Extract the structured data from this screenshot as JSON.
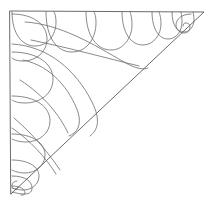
{
  "figure": {
    "background_color": "#ffffff",
    "line_color": "#5a5a5a",
    "plume_line_color": "#6b6b6b",
    "width": 214,
    "height": 205
  },
  "triangle": {
    "name": "outer-triangle",
    "vertices": {
      "top_left": {
        "x": 10,
        "y": 11
      },
      "top_right": {
        "x": 204,
        "y": 12
      },
      "bottom_left": {
        "x": 11,
        "y": 194
      }
    },
    "path": "M10,11 L204,12 L11,194 Z"
  },
  "top_plumes": {
    "name": "top-edge-plumes",
    "count": 6,
    "note": "Teardrop plumes hanging from the top edge, decreasing in size toward the right apex",
    "paths": [
      "M12,12 C12,34 22,46 35,46 C48,46 56,35 56,22 C56,14 54,12 54,12",
      "M46,12 C46,38 57,52 72,52 C87,52 96,38 96,23 C96,14 94,12 94,12",
      "M86,12 C86,36 97,50 111,50 C124,50 132,37 132,25 C132,16 130,12 130,12",
      "M122,12 C122,33 131,45 143,45 C154,45 161,34 161,24 C161,16 159,12 159,12",
      "M152,12 C152,29 159,39 168,39 C177,39 182,30 182,22 C182,16 181,12 181,12",
      "M172,12 C172,25 177,32 184,32 C190,32 194,26 194,20 C194,15 193,12 193,12"
    ]
  },
  "left_plumes": {
    "name": "left-edge-plumes",
    "count": 7,
    "note": "Teardrop plumes extending from the left edge, decreasing in size toward the bottom vertex",
    "paths": [
      "M12,14 C34,14 47,25 47,39 C47,52 36,61 23,61 C14,61 12,58 12,58",
      "M12,52 C38,52 53,64 53,79 C53,94 40,103 25,103 C15,103 12,100 12,100",
      "M12,96 C36,96 50,107 50,121 C50,134 38,142 26,142 C17,142 12,139 12,139",
      "M12,134 C33,134 45,143 45,155 C45,166 35,173 25,173 C17,173 12,170 12,170",
      "M12,160 C29,160 39,167 39,176 C39,185 31,190 23,190 C17,190 12,188 12,188",
      "M12,176 C25,176 32,181 32,188 C32,193 28,194 24,194 C19,194 12,192 12,192",
      "M12,186 C20,186 25,189 25,193 C25,195 23,195 21,195"
    ]
  },
  "inner_plumes": {
    "name": "inner-tier-curves",
    "count": 5,
    "note": "Large sweeping second-tier curves that terminate on the hypotenuse",
    "paths": [
      "M25,22 C60,24 93,44 124,62 C136,69 144,70 148,68",
      "M23,60 C52,66 70,90 78,112 C82,125 77,133 69,136",
      "M31,40 C70,48 106,58 139,66",
      "M20,80 C45,96 60,116 68,133",
      "M14,118 C34,135 50,155 60,170"
    ]
  },
  "spine": {
    "name": "inner-spine",
    "note": "Long inner curve running from the top-left region toward the lower hypotenuse",
    "paths": [
      "M12,44 C48,46 76,70 92,102 C101,120 98,130 90,136",
      "M12,128 C30,140 46,158 56,174"
    ]
  },
  "curls": {
    "name": "terminal-curls",
    "count": 2,
    "note": "Small spiral curls at the narrow tips of the motif",
    "paths": [
      "M191,14 C182,14 176,19 176,25 C176,30 180,33 184,33 C188,33 190,30 190,27 C190,24 188,23 186,23 C184,23 183,24 183,26",
      "M17,181 C14,181 12,183 12,186 C12,188 14,189 16,189 C17,189 18,188 18,187"
    ]
  },
  "hypotenuse_junctions": {
    "name": "hypotenuse-junctions",
    "note": "Points where inner plume curves meet the hypotenuse",
    "points": [
      {
        "x": 148,
        "y": 68
      },
      {
        "x": 69,
        "y": 136
      }
    ]
  }
}
